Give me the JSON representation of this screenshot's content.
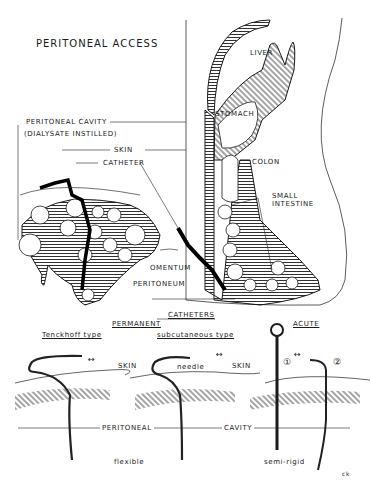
{
  "title": "PERITONEAL ACCESS",
  "anatomy_labels": {
    "liver": "LIVER",
    "stomach": "STOMACH",
    "colon": "COLON",
    "small_intestine_1": "SMALL",
    "small_intestine_2": "INTESTINE",
    "peritoneal_cavity": "PERITONEAL CAVITY",
    "dialysate": "(DIALYSATE INSTILLED)",
    "skin": "SKIN",
    "catheter": "CATHETER",
    "omentum": "OMENTUM",
    "peritoneum": "PERITONEUM"
  },
  "catheters": {
    "heading": "CATHETERS",
    "permanent": "PERMANENT",
    "acute": "ACUTE",
    "tenckhoff": "Tenckhoff type",
    "subcutaneous": "subcutaneous type",
    "needle": "needle",
    "skin_1": "SKIN",
    "skin_2": "SKIN",
    "marker_1": "①",
    "marker_2": "②",
    "arrows": "↔",
    "peritoneal": "PERITONEAL",
    "cavity": "CAVITY",
    "flexible": "flexible",
    "semi_rigid": "semi-rigid"
  },
  "signature": "ck",
  "colors": {
    "ink": "#1a1a1a",
    "background": "#ffffff"
  }
}
